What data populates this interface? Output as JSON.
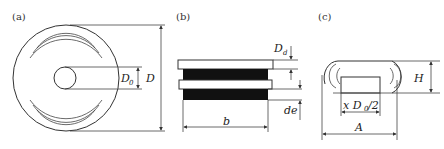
{
  "panels": {
    "a": {
      "label": "(a)",
      "dims": {
        "inner": "D",
        "inner_sub": "0",
        "outer": "D"
      }
    },
    "b": {
      "label": "(b)",
      "dims": {
        "spacing": "D",
        "spacing_sub": "d",
        "gap": "de",
        "width": "b"
      }
    },
    "c": {
      "label": "(c)",
      "dims": {
        "height": "H",
        "inner_prefix": "x D",
        "inner_sub": "0",
        "inner_suffix": "/2",
        "width": "A"
      }
    }
  },
  "colors": {
    "line": "#333333",
    "fill_dark": "#111111",
    "background": "#ffffff"
  }
}
